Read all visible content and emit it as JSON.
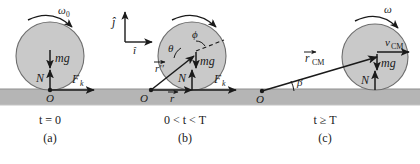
{
  "figure": {
    "colors": {
      "ball_fill": "#c9c9c9",
      "ball_stroke": "#6e6e6e",
      "ground_fill": "#b5b5b5",
      "ground_stroke": "#9a9a9a",
      "ink": "#1a1a1a",
      "background": "#ffffff"
    },
    "axes": {
      "j_label": "ĵ",
      "i_label": "î"
    },
    "panels": [
      {
        "id": "a",
        "caption_time": "t = 0",
        "caption_letter": "(a)",
        "omega_label": "ω",
        "omega_sub": "0",
        "labels": {
          "weight": "mg",
          "normal": "N",
          "friction": "F",
          "friction_sub": "k",
          "origin": "O"
        }
      },
      {
        "id": "b",
        "caption_time": "0 < t < T",
        "caption_letter": "(b)",
        "labels": {
          "weight": "mg",
          "normal": "N",
          "friction": "F",
          "friction_sub": "k",
          "origin": "O",
          "theta": "θ",
          "phi": "ϕ",
          "r_double_prime": "r′′",
          "r_vector": "r"
        }
      },
      {
        "id": "c",
        "caption_time": "t ≥ T",
        "caption_letter": "(c)",
        "omega_label": "ω",
        "labels": {
          "weight": "mg",
          "normal": "N",
          "origin": "O",
          "beta": "β",
          "v_cm": "v",
          "v_cm_sub": "CM",
          "r_cm": "r",
          "r_cm_sub": "CM"
        }
      }
    ]
  }
}
